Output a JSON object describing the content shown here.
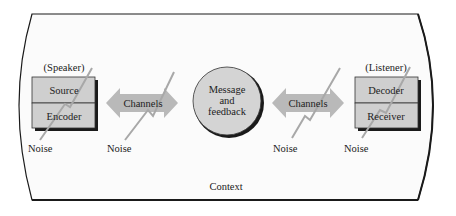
{
  "diagram": {
    "context_label": "Context",
    "speaker": {
      "role_label": "(Speaker)",
      "top_box": "Source",
      "bottom_box": "Encoder",
      "noise_label": "Noise"
    },
    "left_channel": {
      "label": "Channels",
      "noise_label": "Noise"
    },
    "message": {
      "line1": "Message",
      "line2": "and",
      "line3": "feedback"
    },
    "right_channel": {
      "label": "Channels",
      "noise_label": "Noise"
    },
    "listener": {
      "role_label": "(Listener)",
      "top_box": "Decoder",
      "bottom_box": "Receiver",
      "noise_label": "Noise"
    },
    "colors": {
      "box_fill": "#cfcfcf",
      "arrow_fill": "#b9b9b9",
      "circle_fill": "#d4d4d4",
      "noise_line": "#a8a8a8",
      "outline": "#1a1a1a"
    }
  }
}
